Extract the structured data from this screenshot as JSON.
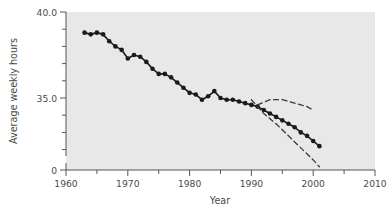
{
  "chart_data": {
    "type": "line",
    "title": "",
    "xlabel": "Year",
    "ylabel": "Average weekly hours",
    "xlim": [
      1960,
      2010
    ],
    "ylim": [
      32.2,
      40.0
    ],
    "y_axis_broken": true,
    "y_axis_break_label": "0",
    "grid": false,
    "legend": "none",
    "x_major_ticks": [
      1960,
      1970,
      1980,
      1990,
      2000,
      2010
    ],
    "x_major_tick_labels": [
      "1960",
      "1970",
      "1980",
      "1990",
      "2000",
      "2010"
    ],
    "x_minor_ticks": [
      1965,
      1975,
      1985,
      1995,
      2005
    ],
    "y_major_ticks": [
      35.0,
      40.0
    ],
    "y_major_tick_labels": [
      "35.0",
      "40.0"
    ],
    "y_minor_ticks": [
      33.0,
      34.0,
      36.0,
      37.0,
      38.0,
      39.0
    ],
    "plot_bgcolor": "#e8e8e8",
    "figure_bgcolor": "#ffffff",
    "series": [
      {
        "name": "Average weekly hours",
        "style": "solid-with-markers",
        "color": "#1a1a1a",
        "x": [
          1963,
          1964,
          1965,
          1966,
          1967,
          1968,
          1969,
          1970,
          1971,
          1972,
          1973,
          1974,
          1975,
          1976,
          1977,
          1978,
          1979,
          1980,
          1981,
          1982,
          1983,
          1984,
          1985,
          1986,
          1987,
          1988,
          1989,
          1990,
          1991,
          1992,
          1993,
          1994,
          1995,
          1996,
          1997,
          1998,
          1999,
          2000,
          2001
        ],
        "values": [
          38.8,
          38.7,
          38.8,
          38.7,
          38.3,
          38.0,
          37.8,
          37.3,
          37.5,
          37.4,
          37.1,
          36.7,
          36.4,
          36.4,
          36.2,
          35.9,
          35.6,
          35.3,
          35.2,
          34.9,
          35.1,
          35.4,
          35.0,
          34.9,
          34.9,
          34.8,
          34.7,
          34.6,
          34.5,
          34.3,
          34.1,
          33.9,
          33.7,
          33.5,
          33.3,
          33.0,
          32.8,
          32.5,
          32.2
        ]
      },
      {
        "name": "Upper projection",
        "style": "dashed",
        "color": "#3a3a3a",
        "x": [
          1991,
          1993,
          1995,
          1997,
          1999,
          2000
        ],
        "values": [
          34.6,
          34.9,
          34.9,
          34.7,
          34.5,
          34.3
        ]
      },
      {
        "name": "Lower projection",
        "style": "dashed",
        "color": "#3a3a3a",
        "x": [
          1990,
          1992,
          1994,
          1996,
          1998,
          2000,
          2001
        ],
        "values": [
          34.9,
          34.1,
          33.5,
          32.8,
          32.1,
          31.4,
          31.0
        ]
      }
    ]
  },
  "axes": {
    "ylabel": "Average weekly hours",
    "xlabel": "Year",
    "y_labels": {
      "top": "40.0",
      "mid": "35.0",
      "zero": "0"
    },
    "x_labels": [
      "1960",
      "1970",
      "1980",
      "1990",
      "2000",
      "2010"
    ]
  }
}
